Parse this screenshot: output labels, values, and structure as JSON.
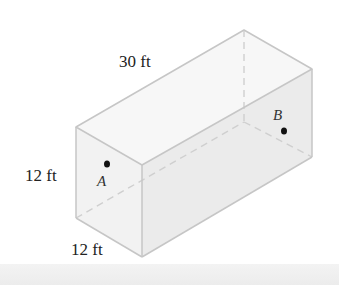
{
  "diagram": {
    "type": "rectangular-prism",
    "dimensions": {
      "length_label": "30 ft",
      "height_label": "12 ft",
      "width_label": "12 ft"
    },
    "points": [
      {
        "name": "A",
        "label": "A",
        "location": "front face"
      },
      {
        "name": "B",
        "label": "B",
        "location": "back face"
      }
    ],
    "colors": {
      "edge": "#c8c8c8",
      "hidden_edge": "#c8c8c8",
      "face_fill": "#f4f4f4",
      "front_face_fill": "#f1f1f1",
      "side_face_fill": "#ebebeb",
      "point": "#111111"
    }
  }
}
